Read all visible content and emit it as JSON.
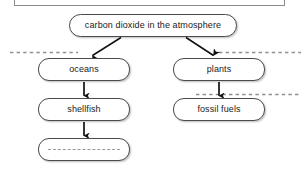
{
  "diagram": {
    "type": "flow-diagram",
    "nodes": [
      {
        "id": "co2",
        "label": "carbon dioxide in the atmosphere",
        "filled": true
      },
      {
        "id": "oceans",
        "label": "oceans",
        "filled": true
      },
      {
        "id": "plants",
        "label": "plants",
        "filled": true
      },
      {
        "id": "shellfish",
        "label": "shellfish",
        "filled": true
      },
      {
        "id": "fossil_fuels",
        "label": "fossil fuels",
        "filled": true
      },
      {
        "id": "blank",
        "label": "",
        "filled": false
      }
    ],
    "edges": [
      {
        "from": "co2",
        "to": "oceans",
        "style": "solid-arrow",
        "direction": "diagonal-down-left"
      },
      {
        "from": "co2",
        "to": "plants",
        "style": "solid-arrow",
        "direction": "diagonal-down-right"
      },
      {
        "from": "oceans",
        "to": "shellfish",
        "style": "solid-arrow",
        "direction": "down"
      },
      {
        "from": "plants",
        "to": "fossil_fuels",
        "style": "solid-arrow",
        "direction": "down"
      },
      {
        "from": "shellfish",
        "to": "blank",
        "style": "solid-arrow",
        "direction": "down"
      }
    ],
    "answer_rules": [
      {
        "id": "rule-top-left",
        "orientation": "horizontal"
      },
      {
        "id": "rule-top-right",
        "orientation": "horizontal"
      },
      {
        "id": "rule-middle-right",
        "orientation": "horizontal"
      },
      {
        "id": "rule-inside-blank",
        "orientation": "horizontal"
      }
    ],
    "colors": {
      "node_border": "#4a4a4a",
      "node_fill": "#ffffff",
      "arrow": "#111111",
      "dashed_rule": "#8f8f8f",
      "frame_border": "#8c8c8c",
      "text": "#1a1a1a",
      "page_background": "#ffffff"
    }
  }
}
